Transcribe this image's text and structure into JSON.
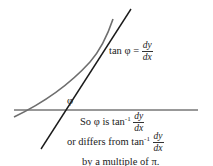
{
  "diagram": {
    "annotation": {
      "lhs": "tan φ =",
      "numerator": "dy",
      "denominator": "dx"
    },
    "angle_label": "φ",
    "caption": {
      "line1_prefix": "So φ is tan",
      "line1_sup": "-1",
      "line1_num": "dy",
      "line1_den": "dx",
      "line2_prefix": "or differs from tan",
      "line2_sup": "-1",
      "line2_num": "dy",
      "line2_den": "dx",
      "line3": "by a multiple of π."
    },
    "colors": {
      "curve": "#6e6e6e",
      "tangent": "#1a1a1a",
      "axis": "#333333"
    }
  }
}
